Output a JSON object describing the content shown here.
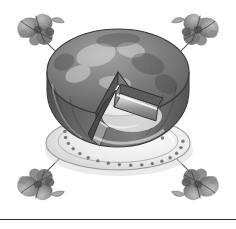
{
  "page": {
    "background_color": "#ffffff",
    "width": 236,
    "height": 229,
    "style": "grayscale-illustration"
  },
  "illustration": {
    "title": "Round cake on beaded plate with one wedge slice removed",
    "alt_text": "Grayscale drawing of a frosted round cake on a beaded-rim serving plate, a triangular slice cut and pulled aside, framed by four wine glasses with grape clusters at the corners",
    "palette": {
      "background": "#ffffff",
      "cake_top_dark": "#6e6e6e",
      "cake_top_mid": "#8a8a8a",
      "cake_top_light": "#a8a8a8",
      "cake_side_dark": "#5a5a5a",
      "cake_side_mid": "#7c7c7c",
      "cake_interior_light": "#e3e3e3",
      "plate_light": "#f2f2f2",
      "plate_shadow": "#c9c9c9",
      "plate_outline": "#8f8f8f",
      "bead_dot": "#6b6b6b",
      "outline": "#3d3d3d",
      "glass_gray": "#9a9a9a",
      "grape_dark": "#5f5f5f",
      "grape_mid": "#858585",
      "rule_color": "#2b2b2b"
    },
    "center_subject": {
      "name": "cake-on-plate",
      "label": "Cake with slice removed",
      "plate": {
        "name": "serving-plate",
        "rim_style": "beaded",
        "bead_count": 34
      },
      "cake": {
        "name": "round-cake",
        "layers": 2,
        "slice_removed": 1,
        "slice_angle_degrees": 62
      }
    },
    "corner_motifs": [
      {
        "name": "corner-motif-top-left",
        "label": "Wine glass with grape cluster",
        "position": "top-left",
        "rotation_degrees": 225
      },
      {
        "name": "corner-motif-top-right",
        "label": "Wine glass with grape cluster",
        "position": "top-right",
        "rotation_degrees": 315
      },
      {
        "name": "corner-motif-bottom-left",
        "label": "Wine glass with grape cluster",
        "position": "bottom-left",
        "rotation_degrees": 135
      },
      {
        "name": "corner-motif-bottom-right",
        "label": "Wine glass with grape cluster",
        "position": "bottom-right",
        "rotation_degrees": 45
      }
    ]
  },
  "footer": {
    "rule_label": "horizontal divider rule",
    "rule_color": "#2b2b2b"
  }
}
